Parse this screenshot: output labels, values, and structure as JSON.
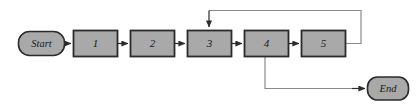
{
  "diagram": {
    "type": "flowchart",
    "colors": {
      "node_fill": "#a9a9a9",
      "node_stroke": "#2b2b2b",
      "connector": "#555555",
      "background": "#ffffff",
      "text": "#1a1a1a"
    },
    "terminals": [
      {
        "id": "start",
        "label": "Start",
        "shape": "rounded-rectangle",
        "x": 18,
        "y": 31,
        "width": 47,
        "height": 25
      },
      {
        "id": "end",
        "label": "End",
        "shape": "rounded-rectangle",
        "x": 367,
        "y": 77,
        "width": 42,
        "height": 24
      }
    ],
    "steps": [
      {
        "id": "step1",
        "label": "1",
        "shape": "rectangle",
        "x": 73,
        "y": 30,
        "width": 45,
        "height": 27
      },
      {
        "id": "step2",
        "label": "2",
        "shape": "rectangle",
        "x": 130,
        "y": 30,
        "width": 45,
        "height": 27
      },
      {
        "id": "step3",
        "label": "3",
        "shape": "rectangle",
        "x": 187,
        "y": 30,
        "width": 45,
        "height": 27
      },
      {
        "id": "step4",
        "label": "4",
        "shape": "rectangle",
        "x": 244,
        "y": 30,
        "width": 45,
        "height": 27
      },
      {
        "id": "step5",
        "label": "5",
        "shape": "rectangle",
        "x": 301,
        "y": 30,
        "width": 45,
        "height": 27
      }
    ],
    "connectors": [
      {
        "id": "start-to-1",
        "from": "start",
        "to": "step1",
        "kind": "straight-right",
        "arrow": true
      },
      {
        "id": "1-to-2",
        "from": "step1",
        "to": "step2",
        "kind": "straight-right",
        "arrow": true
      },
      {
        "id": "2-to-3",
        "from": "step2",
        "to": "step3",
        "kind": "straight-right",
        "arrow": true
      },
      {
        "id": "3-to-4",
        "from": "step3",
        "to": "step4",
        "kind": "straight-right",
        "arrow": true
      },
      {
        "id": "4-to-5",
        "from": "step4",
        "to": "step5",
        "kind": "straight-right",
        "arrow": true
      },
      {
        "id": "5-to-3-feedback",
        "from": "step5",
        "to": "step3",
        "kind": "loop-over-top",
        "arrow": true
      },
      {
        "id": "4-to-end",
        "from": "step4",
        "to": "end",
        "kind": "drop-then-right",
        "arrow": true
      }
    ]
  }
}
